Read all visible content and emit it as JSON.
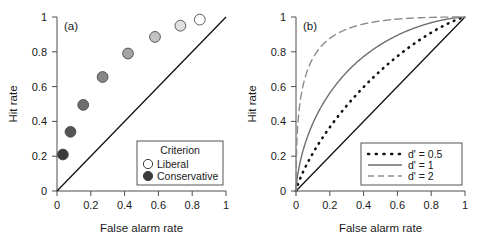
{
  "figure": {
    "panels": [
      {
        "tag": "(a)",
        "xlabel": "False alarm rate",
        "ylabel": "Hit rate",
        "xticks": [
          "0",
          "0.2",
          "0.4",
          "0.6",
          "0.8",
          "1"
        ],
        "yticks": [
          "0",
          "0.2",
          "0.4",
          "0.6",
          "0.8",
          "1"
        ],
        "xtick_values": [
          0,
          0.2,
          0.4,
          0.6,
          0.8,
          1
        ],
        "ytick_values": [
          0,
          0.2,
          0.4,
          0.6,
          0.8,
          1
        ],
        "legend": {
          "title": "Criterion",
          "entries": [
            {
              "label": "Liberal",
              "marker": "open-circle",
              "fill": "#ffffff"
            },
            {
              "label": "Conservative",
              "marker": "filled-circle",
              "fill": "#3a3a3a"
            }
          ]
        }
      },
      {
        "tag": "(b)",
        "xlabel": "False alarm rate",
        "ylabel": "Hit rate",
        "xticks": [
          "0",
          "0.2",
          "0.4",
          "0.6",
          "0.8",
          "1"
        ],
        "yticks": [
          "0",
          "0.2",
          "0.4",
          "0.6",
          "0.8",
          "1"
        ],
        "xtick_values": [
          0,
          0.2,
          0.4,
          0.6,
          0.8,
          1
        ],
        "ytick_values": [
          0,
          0.2,
          0.4,
          0.6,
          0.8,
          1
        ],
        "legend": {
          "title": "",
          "entries": [
            {
              "label": "d' = 0.5",
              "style": "dotted",
              "color": "#111111"
            },
            {
              "label": "d' = 1",
              "style": "solid",
              "color": "#6e6e6e"
            },
            {
              "label": "d' = 2",
              "style": "dashed",
              "color": "#8c8c8c"
            }
          ]
        }
      }
    ]
  },
  "chart_data": [
    {
      "type": "scatter",
      "title": "(a)",
      "xlabel": "False alarm rate",
      "ylabel": "Hit rate",
      "xlim": [
        0,
        1
      ],
      "ylim": [
        0,
        1
      ],
      "grid": false,
      "legend_position": "lower-right",
      "series": [
        {
          "name": "ROC points across criterion levels",
          "x": [
            0.035,
            0.08,
            0.155,
            0.27,
            0.42,
            0.58,
            0.73,
            0.845
          ],
          "y": [
            0.21,
            0.34,
            0.495,
            0.655,
            0.79,
            0.885,
            0.95,
            0.985
          ],
          "marker_fills": [
            "#3a3a3a",
            "#555555",
            "#6f6f6f",
            "#878787",
            "#a3a3a3",
            "#c2c2c2",
            "#e0e0e0",
            "#ffffff"
          ],
          "marker_edge": "#4a4a4a"
        }
      ],
      "reference_line": {
        "name": "chance diagonal",
        "from": [
          0,
          0
        ],
        "to": [
          1,
          1
        ],
        "style": "solid",
        "color": "#111111"
      },
      "annotations": [
        "Criterion",
        "Liberal",
        "Conservative"
      ]
    },
    {
      "type": "line",
      "title": "(b)",
      "xlabel": "False alarm rate",
      "ylabel": "Hit rate",
      "xlim": [
        0,
        1
      ],
      "ylim": [
        0,
        1
      ],
      "grid": false,
      "legend_position": "lower-right",
      "x": [
        0,
        0.02,
        0.05,
        0.1,
        0.15,
        0.2,
        0.3,
        0.4,
        0.5,
        0.6,
        0.7,
        0.8,
        0.9,
        0.95,
        1
      ],
      "series": [
        {
          "name": "d' = 0.5",
          "dprime": 0.5,
          "style": "dotted",
          "color": "#111111",
          "values": [
            0,
            0.1,
            0.17,
            0.26,
            0.33,
            0.39,
            0.5,
            0.59,
            0.67,
            0.75,
            0.82,
            0.89,
            0.95,
            0.98,
            1
          ]
        },
        {
          "name": "d' = 1",
          "dprime": 1,
          "style": "solid",
          "color": "#6e6e6e",
          "values": [
            0,
            0.2,
            0.32,
            0.44,
            0.53,
            0.6,
            0.71,
            0.79,
            0.84,
            0.89,
            0.93,
            0.96,
            0.99,
            0.995,
            1
          ]
        },
        {
          "name": "d' = 2",
          "dprime": 2,
          "style": "dashed",
          "color": "#8c8c8c",
          "values": [
            0,
            0.53,
            0.68,
            0.79,
            0.85,
            0.89,
            0.93,
            0.96,
            0.98,
            0.99,
            0.995,
            0.998,
            0.999,
            1,
            1
          ]
        }
      ],
      "reference_line": {
        "name": "chance diagonal",
        "from": [
          0,
          0
        ],
        "to": [
          1,
          1
        ],
        "style": "solid",
        "color": "#111111"
      },
      "annotations": [
        "d' = 0.5",
        "d' = 1",
        "d' = 2"
      ]
    }
  ]
}
